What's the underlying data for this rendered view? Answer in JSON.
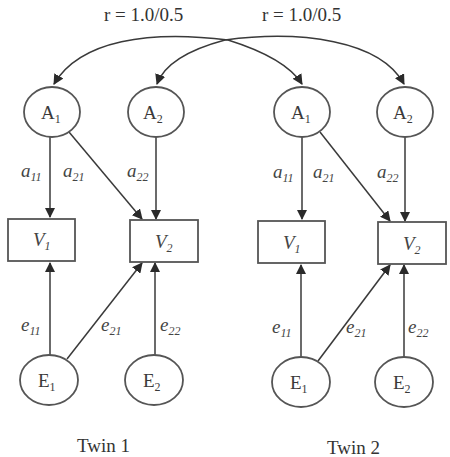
{
  "figure": {
    "type": "ACE twin structural equation path diagram (bivariate Cholesky, A and E)",
    "colors": {
      "stroke": "#555555",
      "text": "#3a3a3a",
      "background": "#ffffff"
    }
  },
  "correlations": [
    {
      "label": "r = 1.0/0.5",
      "from": "twin1.A1",
      "to": "twin2.A1"
    },
    {
      "label": "r = 1.0/0.5",
      "from": "twin1.A2",
      "to": "twin2.A2"
    }
  ],
  "twins": [
    {
      "caption": "Twin 1",
      "latent_a": [
        {
          "base": "A",
          "sub": "1"
        },
        {
          "base": "A",
          "sub": "2"
        }
      ],
      "observed": [
        {
          "base": "V",
          "sub": "1"
        },
        {
          "base": "V",
          "sub": "2"
        }
      ],
      "latent_e": [
        {
          "base": "E",
          "sub": "1"
        },
        {
          "base": "E",
          "sub": "2"
        }
      ],
      "a_paths": [
        {
          "base": "a",
          "sub": "11"
        },
        {
          "base": "a",
          "sub": "21"
        },
        {
          "base": "a",
          "sub": "22"
        }
      ],
      "e_paths": [
        {
          "base": "e",
          "sub": "11"
        },
        {
          "base": "e",
          "sub": "21"
        },
        {
          "base": "e",
          "sub": "22"
        }
      ]
    },
    {
      "caption": "Twin 2",
      "latent_a": [
        {
          "base": "A",
          "sub": "1"
        },
        {
          "base": "A",
          "sub": "2"
        }
      ],
      "observed": [
        {
          "base": "V",
          "sub": "1"
        },
        {
          "base": "V",
          "sub": "2"
        }
      ],
      "latent_e": [
        {
          "base": "E",
          "sub": "1"
        },
        {
          "base": "E",
          "sub": "2"
        }
      ],
      "a_paths": [
        {
          "base": "a",
          "sub": "11"
        },
        {
          "base": "a",
          "sub": "21"
        },
        {
          "base": "a",
          "sub": "22"
        }
      ],
      "e_paths": [
        {
          "base": "e",
          "sub": "11"
        },
        {
          "base": "e",
          "sub": "21"
        },
        {
          "base": "e",
          "sub": "22"
        }
      ]
    }
  ]
}
